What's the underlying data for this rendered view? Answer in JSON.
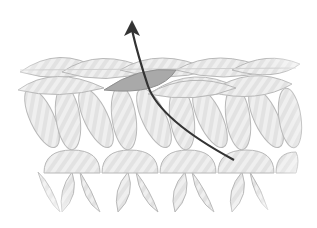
{
  "diagram": {
    "type": "knitting-stitch-illustration",
    "colors": {
      "background": "#ffffff",
      "stitch_fill": "#ececec",
      "stitch_stroke": "#b8b8b8",
      "highlight_fill": "#a9a9a9",
      "arrow": "#333333"
    },
    "elements": {
      "top_chain_count": 4,
      "upper_leg_rows": 1,
      "lower_leg_rows": 1,
      "highlighted_loop": "second chain loop from left",
      "arrow_direction": "up"
    }
  }
}
